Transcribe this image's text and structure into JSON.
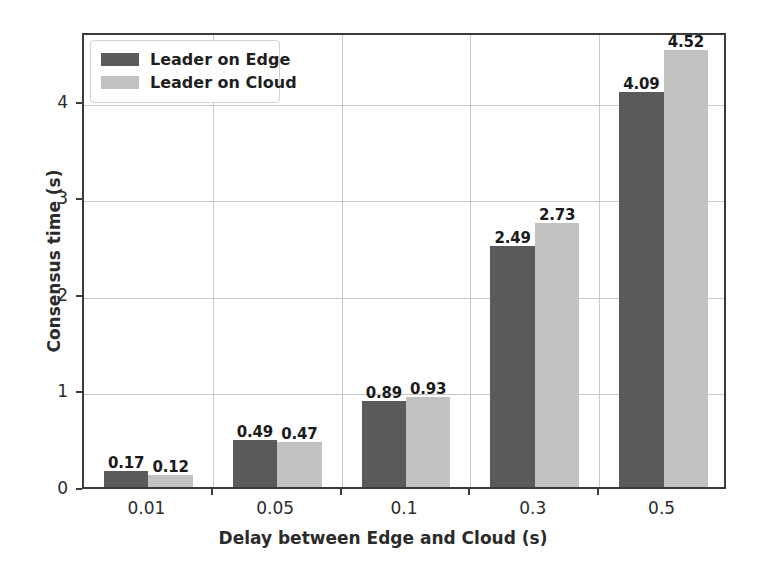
{
  "chart_data": {
    "type": "bar",
    "title": "",
    "xlabel": "Delay between Edge and Cloud (s)",
    "ylabel": "Consensus time (s)",
    "categories": [
      "0.01",
      "0.05",
      "0.1",
      "0.3",
      "0.5"
    ],
    "series": [
      {
        "name": "Leader on Edge",
        "color": "#5a5a5a",
        "values": [
          0.17,
          0.49,
          0.89,
          2.49,
          4.09
        ]
      },
      {
        "name": "Leader on Cloud",
        "color": "#c2c2c2",
        "values": [
          0.12,
          0.47,
          0.93,
          2.73,
          4.52
        ]
      }
    ],
    "value_labels": [
      [
        "0.17",
        "0.12"
      ],
      [
        "0.49",
        "0.47"
      ],
      [
        "0.89",
        "0.93"
      ],
      [
        "2.49",
        "2.73"
      ],
      [
        "4.09",
        "4.52"
      ]
    ],
    "yticks": [
      "0",
      "1",
      "2",
      "3",
      "4"
    ],
    "ytick_values": [
      0,
      1,
      2,
      3,
      4
    ],
    "ylim": [
      0,
      4.72
    ],
    "grid": true,
    "legend_position": "upper left"
  },
  "legend": {
    "items": [
      {
        "label": "Leader on Edge"
      },
      {
        "label": "Leader on Cloud"
      }
    ]
  },
  "axes": {
    "x_label": "Delay between Edge and Cloud (s)",
    "y_label": "Consensus time (s)",
    "x_ticks": [
      "0.01",
      "0.05",
      "0.1",
      "0.3",
      "0.5"
    ],
    "y_ticks": [
      "0",
      "1",
      "2",
      "3",
      "4"
    ]
  }
}
